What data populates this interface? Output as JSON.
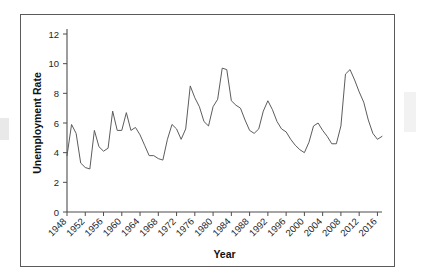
{
  "figure": {
    "border_color": "#5a5a5a",
    "background": "#ffffff"
  },
  "chart_data": {
    "type": "line",
    "title": "",
    "xlabel": "Year",
    "ylabel": "Unemployment Rate",
    "xlim": [
      1948,
      2017
    ],
    "ylim": [
      0,
      12
    ],
    "ytick_labels": [
      "0",
      "2",
      "4",
      "6",
      "8",
      "10",
      "12"
    ],
    "ytick_values": [
      0,
      2,
      4,
      6,
      8,
      10,
      12
    ],
    "xtick_labels": [
      "1948",
      "1952",
      "1956",
      "1960",
      "1964",
      "1968",
      "1972",
      "1976",
      "1980",
      "1984",
      "1988",
      "1992",
      "1996",
      "2000",
      "2004",
      "2008",
      "2012",
      "2016"
    ],
    "xtick_values": [
      1948,
      1952,
      1956,
      1960,
      1964,
      1968,
      1972,
      1976,
      1980,
      1984,
      1988,
      1992,
      1996,
      2000,
      2004,
      2008,
      2012,
      2016
    ],
    "grid": false,
    "legend": false,
    "line_color": "#5c5c5c",
    "x": [
      1948,
      1949,
      1950,
      1951,
      1952,
      1953,
      1954,
      1955,
      1956,
      1957,
      1958,
      1959,
      1960,
      1961,
      1962,
      1963,
      1964,
      1965,
      1966,
      1967,
      1968,
      1969,
      1970,
      1971,
      1972,
      1973,
      1974,
      1975,
      1976,
      1977,
      1978,
      1979,
      1980,
      1981,
      1982,
      1983,
      1984,
      1985,
      1986,
      1987,
      1988,
      1989,
      1990,
      1991,
      1992,
      1993,
      1994,
      1995,
      1996,
      1997,
      1998,
      1999,
      2000,
      2001,
      2002,
      2003,
      2004,
      2005,
      2006,
      2007,
      2008,
      2009,
      2010,
      2011,
      2012,
      2013,
      2014,
      2015,
      2016,
      2017
    ],
    "values": [
      3.8,
      5.9,
      5.3,
      3.3,
      3.0,
      2.9,
      5.5,
      4.4,
      4.1,
      4.3,
      6.8,
      5.5,
      5.5,
      6.7,
      5.5,
      5.7,
      5.2,
      4.5,
      3.8,
      3.8,
      3.6,
      3.5,
      4.9,
      5.9,
      5.6,
      4.9,
      5.6,
      8.5,
      7.7,
      7.1,
      6.1,
      5.8,
      7.1,
      7.6,
      9.7,
      9.6,
      7.5,
      7.2,
      7.0,
      6.2,
      5.5,
      5.3,
      5.6,
      6.8,
      7.5,
      6.9,
      6.1,
      5.6,
      5.4,
      4.9,
      4.5,
      4.2,
      4.0,
      4.7,
      5.8,
      6.0,
      5.5,
      5.1,
      4.6,
      4.6,
      5.8,
      9.3,
      9.6,
      8.9,
      8.1,
      7.4,
      6.2,
      5.3,
      4.9,
      5.1
    ]
  }
}
